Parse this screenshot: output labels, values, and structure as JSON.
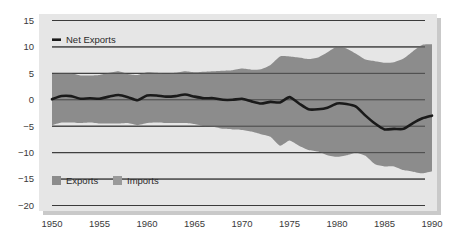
{
  "chart_data": {
    "type": "area",
    "title": "",
    "subtitle": "",
    "xlabel": "",
    "ylabel": "",
    "xlim": [
      1950,
      1990
    ],
    "ylim": [
      -20,
      15
    ],
    "grid": true,
    "legend_position": "inside-top-left-and-bottom-left",
    "background": "#e6e6e6",
    "gridline_color": "#3b3b3b",
    "band_color": "#8c8c8c",
    "line_color": "#1a1a1a",
    "x_ticks": [
      "1950",
      "1955",
      "1960",
      "1965",
      "1970",
      "1975",
      "1980",
      "1985",
      "1990"
    ],
    "x_tick_values": [
      1950,
      1955,
      1960,
      1965,
      1970,
      1975,
      1980,
      1985,
      1990
    ],
    "y_ticks": [
      "15",
      "10",
      "5",
      "0",
      "−5",
      "−10",
      "−15",
      "−20"
    ],
    "y_tick_values": [
      15,
      10,
      5,
      0,
      -5,
      -10,
      -15,
      -20
    ],
    "legend_top": {
      "label": "Net Exports",
      "marker": "line-dash",
      "color": "#1a1a1a"
    },
    "legend_bottom": [
      {
        "label": "Exports",
        "marker": "square-swatch",
        "color": "#8c8c8c"
      },
      {
        "label": "Imports",
        "marker": "square-swatch",
        "color": "#9a9a9a"
      }
    ],
    "x": [
      1950,
      1951,
      1952,
      1953,
      1954,
      1955,
      1956,
      1957,
      1958,
      1959,
      1960,
      1961,
      1962,
      1963,
      1964,
      1965,
      1966,
      1967,
      1968,
      1969,
      1970,
      1971,
      1972,
      1973,
      1974,
      1975,
      1976,
      1977,
      1978,
      1979,
      1980,
      1981,
      1982,
      1983,
      1984,
      1985,
      1986,
      1987,
      1988,
      1989,
      1990
    ],
    "series": [
      {
        "name": "Exports",
        "role": "upper-band",
        "values": [
          4.9,
          5.0,
          5.0,
          4.6,
          4.6,
          4.7,
          5.1,
          5.4,
          4.9,
          4.7,
          5.2,
          5.1,
          5.0,
          5.1,
          5.4,
          5.2,
          5.3,
          5.4,
          5.5,
          5.6,
          5.9,
          5.7,
          5.8,
          6.6,
          8.2,
          8.2,
          8.0,
          7.7,
          8.0,
          9.0,
          10.1,
          9.7,
          8.7,
          7.6,
          7.3,
          7.0,
          7.1,
          7.8,
          9.2,
          10.4,
          10.5
        ]
      },
      {
        "name": "Imports",
        "role": "lower-band",
        "values": [
          -4.8,
          -4.3,
          -4.3,
          -4.4,
          -4.3,
          -4.5,
          -4.5,
          -4.5,
          -4.4,
          -4.8,
          -4.4,
          -4.3,
          -4.4,
          -4.4,
          -4.4,
          -4.6,
          -5.0,
          -5.1,
          -5.5,
          -5.6,
          -5.7,
          -6.0,
          -6.5,
          -7.0,
          -8.7,
          -7.7,
          -8.7,
          -9.5,
          -9.8,
          -10.5,
          -10.8,
          -10.5,
          -10.0,
          -10.6,
          -12.2,
          -12.6,
          -12.6,
          -13.3,
          -13.6,
          -13.9,
          -13.5
        ]
      },
      {
        "name": "Net Exports",
        "role": "line",
        "values": [
          0.1,
          0.7,
          0.7,
          0.2,
          0.3,
          0.2,
          0.6,
          0.9,
          0.5,
          -0.1,
          0.8,
          0.8,
          0.6,
          0.7,
          1.0,
          0.6,
          0.3,
          0.3,
          0.0,
          0.0,
          0.2,
          -0.3,
          -0.7,
          -0.4,
          -0.5,
          0.5,
          -0.7,
          -1.8,
          -1.8,
          -1.5,
          -0.7,
          -0.8,
          -1.3,
          -3.0,
          -4.5,
          -5.6,
          -5.5,
          -5.5,
          -4.4,
          -3.5,
          -3.0
        ]
      }
    ]
  }
}
